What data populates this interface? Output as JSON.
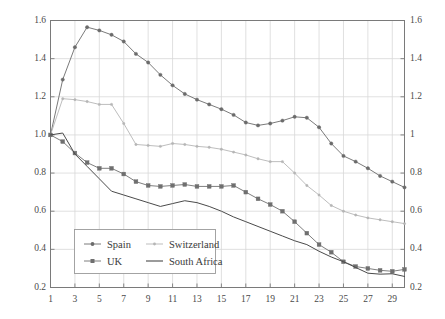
{
  "chart_data": {
    "type": "line",
    "title": "",
    "subtitle": "",
    "xlabel": "",
    "ylabel": "Ratio of observed to implied variance",
    "xlim": [
      1,
      30
    ],
    "ylim": [
      0.2,
      1.6
    ],
    "grid": true,
    "legend_position": "inside-bottom-left",
    "y_tick_labels_left": [
      "1.6",
      "1.4",
      "1.2",
      "1.0",
      "0.8",
      "0.6",
      "0.4",
      "0.2"
    ],
    "y_tick_values": [
      1.6,
      1.4,
      1.2,
      1.0,
      0.8,
      0.6,
      0.4,
      0.2
    ],
    "y_tick_labels_right": [
      "1.6",
      "1.4",
      "1.2",
      "1",
      "0.8",
      "0.6",
      "0.4",
      "0.2"
    ],
    "x_tick_labels": [
      "1",
      "3",
      "5",
      "7",
      "9",
      "11",
      "13",
      "15",
      "17",
      "19",
      "21",
      "23",
      "25",
      "27",
      "29"
    ],
    "x_tick_values": [
      1,
      3,
      5,
      7,
      9,
      11,
      13,
      15,
      17,
      19,
      21,
      23,
      25,
      27,
      29
    ],
    "x": [
      1,
      2,
      3,
      4,
      5,
      6,
      7,
      8,
      9,
      10,
      11,
      12,
      13,
      14,
      15,
      16,
      17,
      18,
      19,
      20,
      21,
      22,
      23,
      24,
      25,
      26,
      27,
      28,
      29,
      30
    ],
    "series": [
      {
        "name": "Spain",
        "color": "#6b6b6b",
        "marker": "small-circle",
        "values": [
          1.0,
          1.29,
          1.46,
          1.565,
          1.548,
          1.525,
          1.49,
          1.425,
          1.38,
          1.315,
          1.26,
          1.215,
          1.185,
          1.16,
          1.135,
          1.105,
          1.065,
          1.05,
          1.06,
          1.075,
          1.095,
          1.09,
          1.04,
          0.955,
          0.89,
          0.86,
          0.825,
          0.785,
          0.755,
          0.725
        ]
      },
      {
        "name": "Switzerland",
        "color": "#b5b5b5",
        "marker": "tiny-circle",
        "values": [
          1.0,
          1.19,
          1.185,
          1.175,
          1.16,
          1.16,
          1.06,
          0.95,
          0.945,
          0.94,
          0.955,
          0.95,
          0.94,
          0.935,
          0.925,
          0.91,
          0.895,
          0.875,
          0.86,
          0.86,
          0.8,
          0.735,
          0.685,
          0.63,
          0.6,
          0.58,
          0.565,
          0.555,
          0.545,
          0.535
        ]
      },
      {
        "name": "UK",
        "color": "#6f6f6f",
        "marker": "filled-square",
        "values": [
          1.0,
          0.965,
          0.905,
          0.855,
          0.825,
          0.825,
          0.795,
          0.755,
          0.735,
          0.73,
          0.735,
          0.74,
          0.73,
          0.73,
          0.73,
          0.735,
          0.7,
          0.665,
          0.635,
          0.6,
          0.545,
          0.485,
          0.425,
          0.385,
          0.335,
          0.31,
          0.3,
          0.29,
          0.285,
          0.295
        ]
      },
      {
        "name": "South Africa",
        "color": "#4a4a4a",
        "marker": "none",
        "values": [
          1.0,
          1.01,
          0.9,
          0.835,
          0.77,
          0.705,
          0.685,
          0.665,
          0.645,
          0.625,
          0.64,
          0.655,
          0.645,
          0.625,
          0.6,
          0.57,
          0.545,
          0.52,
          0.495,
          0.47,
          0.445,
          0.425,
          0.39,
          0.36,
          0.335,
          0.305,
          0.275,
          0.27,
          0.272,
          0.258
        ]
      }
    ]
  },
  "legend": {
    "entries": [
      {
        "label": "Spain"
      },
      {
        "label": "Switzerland"
      },
      {
        "label": "UK"
      },
      {
        "label": "South Africa"
      }
    ]
  }
}
